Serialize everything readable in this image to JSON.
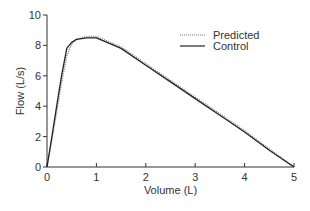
{
  "chart_data": {
    "type": "line",
    "title": "",
    "xlabel": "Volume (L)",
    "ylabel": "Flow (L/s)",
    "xlim": [
      0,
      5
    ],
    "ylim": [
      0,
      10
    ],
    "xticks": [
      "0",
      "1",
      "2",
      "3",
      "4",
      "5"
    ],
    "yticks": [
      "0",
      "2",
      "4",
      "6",
      "8",
      "10"
    ],
    "grid": false,
    "legend_position": "upper right",
    "series": [
      {
        "name": "Predicted",
        "style": "dotted",
        "x": [
          0,
          0.1,
          0.2,
          0.3,
          0.4,
          0.5,
          0.6,
          0.8,
          1.0,
          1.5,
          2.0,
          2.5,
          3.0,
          3.5,
          4.0,
          4.5,
          5.0
        ],
        "y": [
          0,
          1.8,
          3.7,
          5.6,
          7.3,
          8.1,
          8.4,
          8.6,
          8.6,
          7.9,
          6.8,
          5.7,
          4.6,
          3.5,
          2.4,
          1.2,
          0
        ]
      },
      {
        "name": "Control",
        "style": "solid",
        "x": [
          0,
          0.1,
          0.2,
          0.3,
          0.4,
          0.45,
          0.5,
          0.6,
          0.8,
          1.0,
          1.5,
          2.0,
          2.5,
          3.0,
          3.5,
          4.0,
          4.5,
          5.0
        ],
        "y": [
          0,
          2.0,
          4.1,
          6.1,
          7.8,
          8.0,
          8.2,
          8.4,
          8.5,
          8.5,
          7.8,
          6.7,
          5.6,
          4.5,
          3.4,
          2.3,
          1.1,
          0
        ]
      }
    ]
  }
}
